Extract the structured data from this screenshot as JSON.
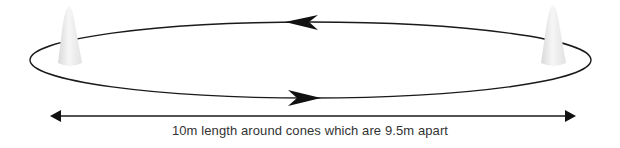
{
  "diagram": {
    "caption": "10m length around cones which are 9.5m apart",
    "colors": {
      "line": "#1a1a1a",
      "cone_dark": "#d4d4d4",
      "cone_light": "#f4f4f4",
      "text": "#333333",
      "background": "#ffffff"
    },
    "track": {
      "shape": "ellipse",
      "direction": "counter-clockwise",
      "center_x": 310.5,
      "center_y": 60,
      "radius_x": 280.5,
      "radius_y": 38
    },
    "cones": [
      {
        "id": "left",
        "tip": [
          69,
          6
        ],
        "base_left": 58,
        "base_right": 82,
        "base_y": 66
      },
      {
        "id": "right",
        "tip": [
          553,
          5
        ],
        "base_left": 541,
        "base_right": 566,
        "base_y": 66
      }
    ],
    "direction_arrows": [
      {
        "id": "top",
        "points": "left",
        "tip_x": 285,
        "y": 22
      },
      {
        "id": "bottom",
        "points": "right",
        "tip_x": 321,
        "y": 98
      }
    ],
    "dimension_line": {
      "x1": 50,
      "x2": 576,
      "y": 116,
      "label": "10m length around cones which are 9.5m apart"
    }
  }
}
